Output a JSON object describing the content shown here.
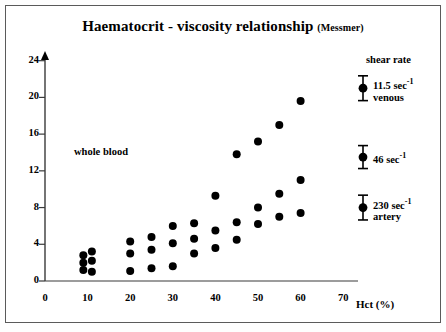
{
  "title": {
    "main": "Haematocrit - viscosity relationship",
    "source": "(Messmer)"
  },
  "annotations": {
    "whole_blood": "whole blood",
    "shear_rate_heading": "shear rate"
  },
  "legend": [
    {
      "value": "11.5 sec",
      "exp": "-1",
      "sub": "venous",
      "y": 21.0,
      "err": 1.35
    },
    {
      "value": "46 sec",
      "exp": "-1",
      "sub": "",
      "y": 13.5,
      "err": 1.25
    },
    {
      "value": "230 sec",
      "exp": "-1",
      "sub": "artery",
      "y": 8.0,
      "err": 1.35
    }
  ],
  "axes": {
    "x": {
      "label": "Hct (%)",
      "ticks": [
        0,
        10,
        20,
        30,
        40,
        50,
        60,
        70
      ],
      "min": 0,
      "max": 74
    },
    "y": {
      "label": "",
      "ticks": [
        0,
        4,
        8,
        12,
        16,
        20,
        24
      ],
      "min": 0,
      "max": 25.5
    }
  },
  "colors": {
    "ink": "#000000",
    "axis": "#3a3a3a",
    "panel": "#ffffff",
    "border": "#5a5a5a"
  },
  "chart_data": {
    "type": "scatter",
    "title": "Haematocrit - viscosity relationship (Messmer)",
    "xlabel": "Hct (%)",
    "ylabel": "viscosity",
    "xlim": [
      0,
      74
    ],
    "ylim": [
      0,
      25.5
    ],
    "grid": false,
    "legend_position": "right",
    "marker": "filled-circle",
    "series": [
      {
        "name": "11.5 sec-1 (venous)",
        "points": [
          [
            9,
            1.2
          ],
          [
            9,
            2.0
          ],
          [
            9,
            2.8
          ],
          [
            11,
            1.0
          ],
          [
            11,
            2.2
          ],
          [
            11,
            3.2
          ],
          [
            20,
            1.1
          ],
          [
            20,
            3.0
          ],
          [
            20,
            4.3
          ],
          [
            25,
            1.4
          ],
          [
            25,
            3.4
          ],
          [
            25,
            4.8
          ],
          [
            30,
            1.6
          ],
          [
            30,
            4.1
          ],
          [
            30,
            6.0
          ],
          [
            35,
            3.0
          ],
          [
            35,
            4.6
          ],
          [
            35,
            6.3
          ],
          [
            40,
            3.6
          ],
          [
            40,
            5.5
          ],
          [
            40,
            9.3
          ],
          [
            45,
            4.5
          ],
          [
            45,
            6.4
          ],
          [
            45,
            13.8
          ],
          [
            50,
            6.2
          ],
          [
            50,
            8.0
          ],
          [
            50,
            15.2
          ],
          [
            55,
            7.0
          ],
          [
            55,
            9.5
          ],
          [
            55,
            17.0
          ],
          [
            60,
            7.4
          ],
          [
            60,
            11.0
          ],
          [
            60,
            19.6
          ]
        ]
      }
    ],
    "error_bar_markers": [
      {
        "label": "11.5 sec-1 venous",
        "x": 65,
        "y": 21.0,
        "err": 1.35
      },
      {
        "label": "46 sec-1",
        "x": 65,
        "y": 13.5,
        "err": 1.25
      },
      {
        "label": "230 sec-1 artery",
        "x": 62,
        "y": 8.0,
        "err": 1.35
      }
    ]
  }
}
